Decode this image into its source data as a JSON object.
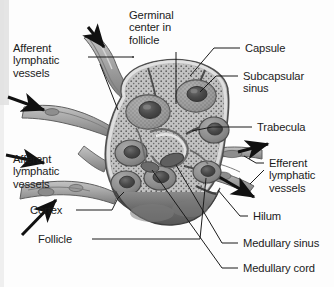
{
  "figure": {
    "type": "anatomical-illustration",
    "style": "grayscale halftone textbook drawing",
    "colors": {
      "background": "#fdfdfd",
      "text": "#1b1b1b",
      "leader_line": "#1b1b1b",
      "capsule": "#8d8d8d",
      "cortex_fill": "#b9b9b9",
      "follicle": "#8a8a8a",
      "germinal_center": "#4a4a4a",
      "medulla": "#6e6e6e",
      "vessel": "#a8a8a8",
      "vessel_shadow": "#6f6f6f",
      "scan_band": "#cfcfcf"
    }
  },
  "labels": {
    "germinal_center": "Germinal\ncenter in\nfollicle",
    "afferent_top": "Afferent\nlymphatic\nvessels",
    "afferent_bottom": "Afferent\nlymphatic\nvessels",
    "capsule": "Capsule",
    "subcapsular_sinus": "Subcapsular\nsinus",
    "trabecula": "Trabecula",
    "efferent": "Efferent\nlymphatic\nvessels",
    "hilum": "Hilum",
    "medullary_sinus": "Medullary sinus",
    "medullary_cord": "Medullary cord",
    "cortex": "Cortex",
    "follicle": "Follicle"
  },
  "structures": [
    {
      "name": "germinal-center-in-follicle",
      "side": "top"
    },
    {
      "name": "afferent-lymphatic-vessels-upper",
      "side": "left",
      "flow": "inward"
    },
    {
      "name": "afferent-lymphatic-vessels-lower",
      "side": "left",
      "flow": "inward"
    },
    {
      "name": "capsule",
      "side": "right"
    },
    {
      "name": "subcapsular-sinus",
      "side": "right"
    },
    {
      "name": "trabecula",
      "side": "right"
    },
    {
      "name": "efferent-lymphatic-vessels",
      "side": "right",
      "flow": "outward"
    },
    {
      "name": "hilum",
      "side": "right"
    },
    {
      "name": "medullary-sinus",
      "side": "right"
    },
    {
      "name": "medullary-cord",
      "side": "right"
    },
    {
      "name": "cortex",
      "side": "left"
    },
    {
      "name": "follicle",
      "side": "left"
    }
  ]
}
